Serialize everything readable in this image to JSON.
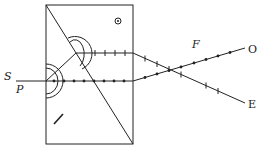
{
  "diagram": {
    "labels": {
      "source": "S",
      "polarizer": "P",
      "focus": "F",
      "ordinary": "O",
      "extraordinary": "E"
    },
    "colors": {
      "line": "#222222",
      "background": "#ffffff"
    },
    "elements": {
      "prism_outline": "rectangle split by diagonal",
      "optic_axis_top": "dot-in-circle (axis perpendicular to page)",
      "optic_axis_bottom": "slash (axis in plane of page)",
      "ray_o_markers": "dots",
      "ray_e_markers": "ticks"
    }
  }
}
